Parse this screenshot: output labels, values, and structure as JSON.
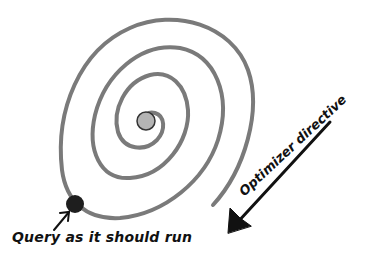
{
  "diagram": {
    "top_cut_text": "",
    "labels": {
      "query": "Query as it should run",
      "optimizer": "Optimizer directive"
    },
    "nodes": {
      "center_ball": {
        "color": "#b4b4b4",
        "outline": "#333333"
      },
      "query_ball": {
        "color": "#1e1e1e"
      }
    },
    "colors": {
      "spiral": "#7a7a7a",
      "arrow": "#111111"
    }
  }
}
